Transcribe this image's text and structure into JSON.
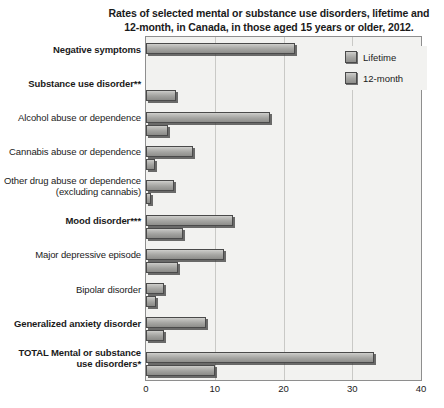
{
  "chart_data": {
    "type": "bar",
    "orientation": "horizontal",
    "title": "Rates of selected mental or substance use disorders, lifetime and 12-month, in Canada, in those aged 15 years or older, 2012.",
    "title_lines": [
      "Rates of selected mental or substance use disorders, lifetime and",
      "12-month, in Canada, in those aged 15 years or older, 2012."
    ],
    "xlabel": "",
    "ylabel": "",
    "xlim": [
      0,
      40
    ],
    "xticks": [
      0,
      10,
      20,
      30,
      40
    ],
    "xtick_labels": [
      "0",
      "10",
      "20",
      "30",
      "40"
    ],
    "grid": true,
    "legend_position": "top-right",
    "categories": [
      "Negative symptoms",
      "Substance use disorder**",
      "Alcohol abuse or dependence",
      "Cannabis abuse or dependence",
      "Other drug abuse or dependence (excluding cannabis)",
      "Mood disorder***",
      "Major depressive episode",
      "Bipolar disorder",
      "Generalized anxiety disorder",
      "TOTAL Mental or substance use disorders*"
    ],
    "series": [
      {
        "name": "Lifetime",
        "values": [
          21.6,
          null,
          18.1,
          6.8,
          4.0,
          12.6,
          11.3,
          2.6,
          8.7,
          33.1
        ]
      },
      {
        "name": "12-month",
        "values": [
          null,
          4.4,
          3.2,
          1.3,
          0.7,
          5.4,
          4.7,
          1.5,
          2.6,
          10.1
        ]
      }
    ],
    "colors": {
      "lifetime": "#a5a5a2",
      "twelve_month": "#a2a29f",
      "bar_border": "#4a4a4a",
      "plot_background": "#f2f2f0",
      "gridline": "#c9c9c6",
      "text": "#1a1a1a"
    }
  },
  "categories_display": [
    {
      "lines": [
        "Negative symptoms"
      ],
      "bold": true
    },
    {
      "lines": [
        "Substance use disorder**"
      ],
      "bold": true
    },
    {
      "lines": [
        "Alcohol abuse or dependence"
      ],
      "bold": false
    },
    {
      "lines": [
        "Cannabis abuse or dependence"
      ],
      "bold": false
    },
    {
      "lines": [
        "Other drug abuse or dependence",
        "(excluding cannabis)"
      ],
      "bold": false
    },
    {
      "lines": [
        "Mood disorder***"
      ],
      "bold": true
    },
    {
      "lines": [
        "Major depressive episode"
      ],
      "bold": false
    },
    {
      "lines": [
        "Bipolar disorder"
      ],
      "bold": false
    },
    {
      "lines": [
        "Generalized anxiety disorder"
      ],
      "bold": true
    },
    {
      "lines": [
        "TOTAL Mental or substance",
        "use disorders*"
      ],
      "bold": true
    }
  ],
  "legend": {
    "items": [
      {
        "label": "Lifetime",
        "key": "lifetime"
      },
      {
        "label": "12-month",
        "key": "twelve_month"
      }
    ]
  }
}
